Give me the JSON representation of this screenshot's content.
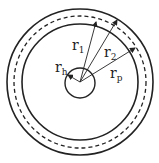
{
  "diagram": {
    "type": "concentric-circles-radii",
    "center": [
      80,
      82
    ],
    "circles": {
      "outer": {
        "r": 73,
        "style": "solid"
      },
      "pitch": {
        "r": 66,
        "style": "dashed"
      },
      "inner": {
        "r": 58,
        "style": "solid"
      },
      "hub": {
        "r": 15,
        "style": "solid"
      }
    },
    "labels": {
      "r1": {
        "base": "r",
        "sub": "1"
      },
      "r2": {
        "base": "r",
        "sub": "2"
      },
      "rp": {
        "base": "r",
        "sub": "p"
      },
      "rh": {
        "base": "r",
        "sub": "h"
      }
    },
    "stroke_color": "#222222"
  }
}
